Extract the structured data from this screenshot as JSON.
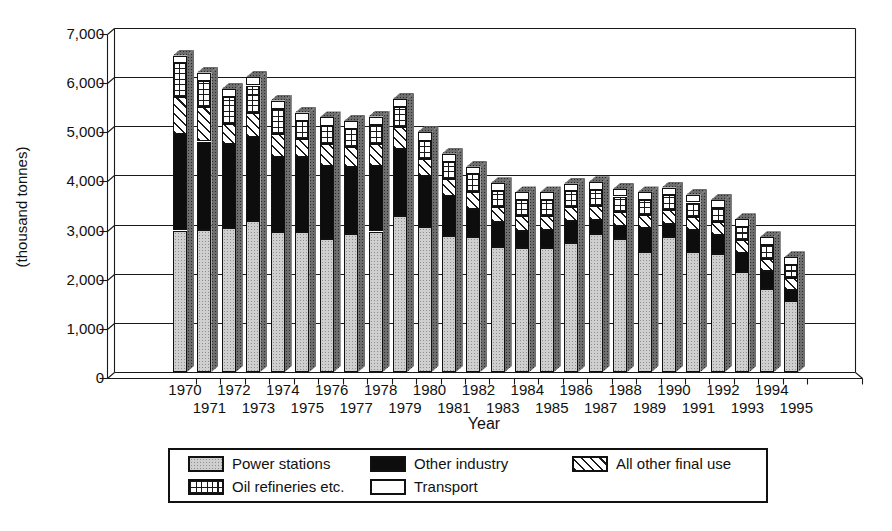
{
  "chart_data": {
    "type": "bar",
    "stacked": true,
    "bar_style": "3d",
    "grid": true,
    "xlabel": "Year",
    "ylabel": "(thousand tonnes)",
    "ylim": [
      0,
      7000
    ],
    "y_ticks": [
      "7,000",
      "6,000",
      "5,000",
      "4,000",
      "3,000",
      "2,000",
      "1,000",
      "0"
    ],
    "categories": [
      "1970",
      "1971",
      "1972",
      "1973",
      "1974",
      "1975",
      "1976",
      "1977",
      "1978",
      "1979",
      "1980",
      "1981",
      "1982",
      "1983",
      "1984",
      "1985",
      "1986",
      "1987",
      "1988",
      "1989",
      "1990",
      "1991",
      "1992",
      "1993",
      "1994",
      "1995"
    ],
    "stack_order": "bottom-to-top",
    "series": [
      {
        "name": "Power stations",
        "pattern": "gray",
        "values": [
          2880,
          2890,
          2940,
          3080,
          2840,
          2850,
          2710,
          2810,
          2860,
          3180,
          2945,
          2775,
          2740,
          2550,
          2525,
          2530,
          2620,
          2800,
          2700,
          2450,
          2740,
          2450,
          2400,
          2030,
          1690,
          1440
        ]
      },
      {
        "name": "Other industry",
        "pattern": "black",
        "values": [
          1960,
          1800,
          1700,
          1710,
          1530,
          1520,
          1490,
          1360,
          1340,
          1360,
          1050,
          815,
          575,
          495,
          350,
          360,
          445,
          295,
          280,
          480,
          270,
          440,
          395,
          385,
          370,
          230
        ]
      },
      {
        "name": "All other final use",
        "pattern": "diag",
        "values": [
          760,
          705,
          410,
          480,
          475,
          370,
          440,
          405,
          440,
          440,
          340,
          340,
          340,
          305,
          305,
          290,
          300,
          290,
          270,
          270,
          285,
          270,
          250,
          270,
          240,
          245
        ]
      },
      {
        "name": "Oil refineries etc.",
        "pattern": "grid",
        "values": [
          680,
          530,
          550,
          560,
          510,
          370,
          370,
          370,
          395,
          405,
          375,
          340,
          370,
          340,
          320,
          320,
          315,
          325,
          320,
          300,
          310,
          290,
          290,
          270,
          290,
          270
        ]
      },
      {
        "name": "Transport",
        "pattern": "white",
        "values": [
          160,
          170,
          160,
          170,
          170,
          170,
          170,
          165,
          165,
          170,
          170,
          170,
          150,
          150,
          155,
          155,
          150,
          150,
          155,
          155,
          150,
          155,
          165,
          155,
          150,
          150
        ]
      }
    ],
    "legend": {
      "position": "bottom",
      "items": [
        {
          "label": "Power stations",
          "pattern": "gray"
        },
        {
          "label": "Oil refineries etc.",
          "pattern": "grid"
        },
        {
          "label": "Other industry",
          "pattern": "black"
        },
        {
          "label": "Transport",
          "pattern": "white"
        },
        {
          "label": "All other final use",
          "pattern": "diag"
        }
      ]
    },
    "colors": {
      "line": "#1a1a1a",
      "gray_fill": "#cfcfcf",
      "dark_side": "#6e6e6e",
      "background": "#ffffff"
    }
  }
}
